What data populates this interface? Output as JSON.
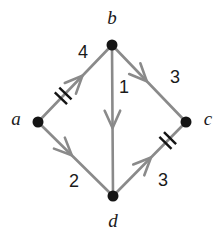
{
  "figure": {
    "type": "directed-weighted-graph",
    "background_color": "#ffffff",
    "edge_color": "#8a8a8a",
    "node_color": "#141414",
    "label_color": "#1a1a1a",
    "width": 222,
    "height": 245
  },
  "nodes": [
    {
      "id": "b",
      "label": "b",
      "x": 112,
      "y": 45,
      "label_x": 112,
      "label_y": 20,
      "radius": 5.5
    },
    {
      "id": "a",
      "label": "a",
      "x": 38,
      "y": 122,
      "label_x": 16,
      "label_y": 121,
      "radius": 5.5
    },
    {
      "id": "c",
      "label": "c",
      "x": 186,
      "y": 122,
      "label_x": 208,
      "label_y": 121,
      "radius": 5.5
    },
    {
      "id": "d",
      "label": "d",
      "x": 113,
      "y": 196,
      "label_x": 113,
      "label_y": 223,
      "radius": 5.5
    }
  ],
  "edges": [
    {
      "id": "a-b",
      "from": "a",
      "to": "b",
      "label": "4",
      "label_x": 83,
      "label_y": 53,
      "x1": 38,
      "y1": 122,
      "x2": 112,
      "y2": 45,
      "arrow_t": 0.6,
      "ticks": 2,
      "tick_t": 0.34,
      "directed": true
    },
    {
      "id": "b-c",
      "from": "b",
      "to": "c",
      "label": "3",
      "label_x": 175,
      "label_y": 78,
      "x1": 112,
      "y1": 45,
      "x2": 186,
      "y2": 122,
      "arrow_t": 0.47,
      "ticks": 0,
      "tick_t": 0.5,
      "directed": true
    },
    {
      "id": "b-d",
      "from": "b",
      "to": "d",
      "label": "1",
      "label_x": 124,
      "label_y": 88,
      "x1": 112,
      "y1": 45,
      "x2": 113,
      "y2": 196,
      "arrow_t": 0.55,
      "ticks": 0,
      "tick_t": 0.5,
      "directed": true
    },
    {
      "id": "a-d",
      "from": "a",
      "to": "d",
      "label": "2",
      "label_x": 74,
      "label_y": 182,
      "x1": 38,
      "y1": 122,
      "x2": 113,
      "y2": 196,
      "arrow_t": 0.45,
      "ticks": 0,
      "tick_t": 0.5,
      "directed": true
    },
    {
      "id": "d-c",
      "from": "d",
      "to": "c",
      "label": "3",
      "label_x": 163,
      "label_y": 181,
      "x1": 113,
      "y1": 196,
      "x2": 186,
      "y2": 122,
      "arrow_t": 0.52,
      "ticks": 2,
      "tick_t": 0.75,
      "directed": true
    }
  ],
  "legend": {
    "node_ids": [
      "a",
      "b",
      "c",
      "d"
    ],
    "edge_weights": [
      "4",
      "3",
      "1",
      "2",
      "3"
    ]
  }
}
